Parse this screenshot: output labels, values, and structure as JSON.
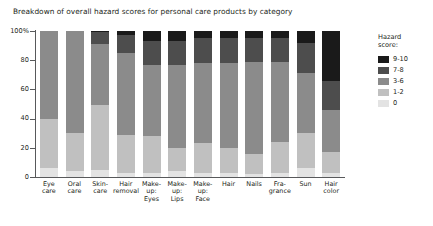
{
  "chart_data": {
    "type": "bar",
    "subtype": "stacked-percentage",
    "title": "Breakdown of overall hazard scores for personal care products by category",
    "xlabel": "",
    "ylabel": "",
    "ylim": [
      0,
      100
    ],
    "grid": false,
    "legend_position": "right",
    "legend_title": "Hazard score:",
    "y_ticks": [
      "100%",
      "80",
      "60",
      "40",
      "20",
      "0"
    ],
    "y_tick_values": [
      100,
      80,
      60,
      40,
      20,
      0
    ],
    "categories": [
      "Eye care",
      "Oral care",
      "Skin-care",
      "Hair removal",
      "Make-up: Eyes",
      "Make-up: Lips",
      "Make-up: Face",
      "Hair",
      "Nails",
      "Fragrance",
      "Sun",
      "Hair color"
    ],
    "category_label_lines": [
      [
        "Eye",
        "care"
      ],
      [
        "Oral",
        "care"
      ],
      [
        "Skin-",
        "care"
      ],
      [
        "Hair",
        "removal"
      ],
      [
        "Make-",
        "up:",
        "Eyes"
      ],
      [
        "Make-",
        "up:",
        "Lips"
      ],
      [
        "Make-",
        "up:",
        "Face"
      ],
      [
        "Hair"
      ],
      [
        "Nails"
      ],
      [
        "Fra-",
        "grance"
      ],
      [
        "Sun"
      ],
      [
        "Hair",
        "color"
      ]
    ],
    "series": [
      {
        "name": "0",
        "color": "#e3e3e3",
        "values": [
          6,
          4,
          5,
          3,
          3,
          4,
          3,
          3,
          2,
          3,
          6,
          3
        ]
      },
      {
        "name": "1-2",
        "color": "#c0c0c0",
        "values": [
          34,
          26,
          44,
          26,
          25,
          16,
          20,
          17,
          14,
          21,
          24,
          14
        ]
      },
      {
        "name": "3-6",
        "color": "#8b8b8b",
        "values": [
          60,
          70,
          42,
          56,
          49,
          57,
          55,
          58,
          63,
          55,
          41,
          29
        ]
      },
      {
        "name": "7-8",
        "color": "#4d4d4d",
        "values": [
          0,
          0,
          8,
          12,
          16,
          16,
          17,
          17,
          16,
          16,
          21,
          20
        ]
      },
      {
        "name": "9-10",
        "color": "#1a1a1a",
        "values": [
          0,
          0,
          1,
          3,
          7,
          7,
          5,
          5,
          5,
          5,
          8,
          34
        ]
      }
    ],
    "legend_entries": [
      {
        "label": "9-10",
        "color": "#1a1a1a"
      },
      {
        "label": "7-8",
        "color": "#4d4d4d"
      },
      {
        "label": "3-6",
        "color": "#8b8b8b"
      },
      {
        "label": "1-2",
        "color": "#c0c0c0"
      },
      {
        "label": "0",
        "color": "#e3e3e3"
      }
    ],
    "legend_title_lines": [
      "Hazard",
      "score:"
    ],
    "axis_color": "#58595b",
    "background_color": "#ffffff"
  }
}
